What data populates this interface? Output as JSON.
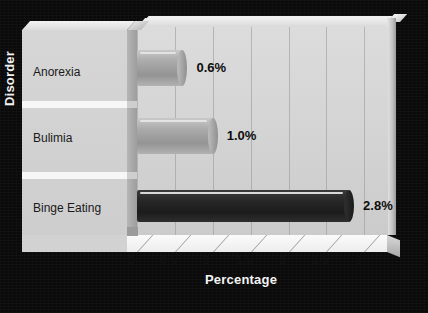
{
  "chart_data": {
    "type": "bar",
    "orientation": "horizontal",
    "title": "",
    "xlabel": "Percentage",
    "ylabel": "Disorder",
    "categories": [
      "Anorexia",
      "Bulimia",
      "Binge Eating"
    ],
    "values": [
      0.6,
      1.0,
      2.8
    ],
    "data_labels": [
      "0.6%",
      "1.0%",
      "2.8%"
    ],
    "xlim": [
      0,
      3.3
    ],
    "xticks": [
      0,
      0.5,
      1,
      1.5,
      2,
      2.5,
      3
    ],
    "xtick_labels": [
      "0",
      "0.5",
      "1",
      "1.5",
      "2",
      "2.5",
      "3"
    ],
    "grid": "vertical",
    "legend": "none",
    "style": "3d-cylinder",
    "series": [
      {
        "name": "Percentage",
        "points": [
          {
            "category": "Anorexia",
            "value": 0.6,
            "label": "0.6%",
            "color": "#a0a0a0"
          },
          {
            "category": "Bulimia",
            "value": 1.0,
            "label": "1.0%",
            "color": "#9a9a9a"
          },
          {
            "category": "Binge Eating",
            "value": 2.8,
            "label": "2.8%",
            "color": "#2b2b2b"
          }
        ]
      }
    ]
  },
  "colors": {
    "background": "#0a0a0a",
    "plot_area": "#d4d4d4",
    "panel": "#d2d2d2",
    "axis_text": "#101010",
    "title_text": "#f2f2f2",
    "bar_light": "#a0a0a0",
    "bar_dark": "#2b2b2b"
  }
}
